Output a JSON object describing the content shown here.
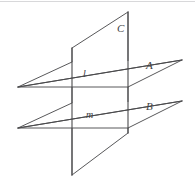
{
  "figure": {
    "background_color": "#ffffff",
    "stroke_color": "#58585a",
    "label_color": "#414143",
    "width": 195,
    "height": 183
  },
  "labels": {
    "plane_c": "C",
    "plane_a": "A",
    "plane_b": "B",
    "line_l": "l",
    "line_m": "m"
  },
  "elements": {
    "plane_a_name": "horizontal-plane-A",
    "plane_b_name": "horizontal-plane-B",
    "plane_c_name": "vertical-plane-C",
    "line_l_name": "intersection-line-l",
    "line_m_name": "intersection-line-m"
  },
  "geometry": {
    "plane_a_outline": "18,87 72,62 182,60 128,87",
    "plane_b_outline": "18,128 72,103 182,101 128,128",
    "plane_c_outline": "72,48 128,12 128,133 72,175",
    "line_l": "18,87 182,60",
    "line_m": "18,128 182,101",
    "vertical_left": "72,48 72,175",
    "vertical_right": "128,12 128,133"
  }
}
